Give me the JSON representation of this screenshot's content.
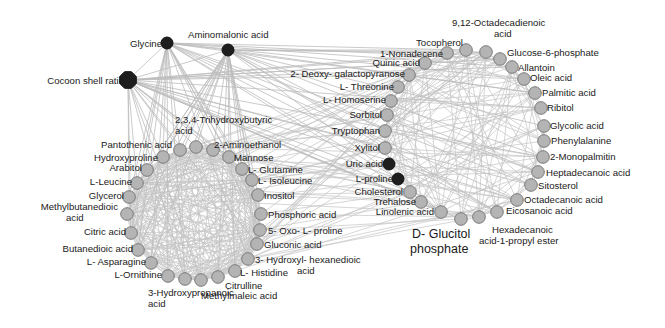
{
  "diagram": {
    "type": "correlation-network",
    "colors": {
      "edge": "#c4c4c4",
      "node_metabolite": "#b4b4b4",
      "node_metabolite_stroke": "#7a7a7a",
      "node_hub": "#1e1e1e",
      "text": "#1a1a1a"
    },
    "hubs": [
      {
        "id": "cocoon",
        "label": "Cocoon shell ratio",
        "x": 128,
        "y": 80,
        "r": 9,
        "lx": 124,
        "ly": 84,
        "anchor": "end",
        "size": "normal"
      },
      {
        "id": "glycine",
        "label": "Glycine",
        "x": 167,
        "y": 43,
        "r": 6,
        "lx": 162,
        "ly": 47,
        "anchor": "end",
        "size": "normal"
      },
      {
        "id": "aminomalonic",
        "label": "Aminomalonic acid",
        "x": 228,
        "y": 50,
        "r": 6,
        "lx": 188,
        "ly": 38,
        "anchor": "start",
        "size": "normal"
      }
    ],
    "clusters": [
      {
        "name": "left-cluster",
        "nodes": [
          {
            "label": "Hydroxyproline",
            "x": 163,
            "y": 157,
            "lines": [
              "Hydroxyproline"
            ],
            "lx": 158,
            "ly": 161,
            "anchor": "end"
          },
          {
            "label": "Pantothenic acid",
            "x": 180,
            "y": 150,
            "lines": [
              "Pantothenic acid"
            ],
            "lx": 172,
            "ly": 148,
            "anchor": "end"
          },
          {
            "label": "2,3,4-Trihydroxybutyric acid",
            "x": 196,
            "y": 147,
            "lines": [
              "2,3,4-Trihydroxybutyric",
              "acid"
            ],
            "lx": 175,
            "ly": 123,
            "anchor": "start"
          },
          {
            "label": "2-Aminoethanol",
            "x": 213,
            "y": 150,
            "lines": [
              "2-Aminoethanol"
            ],
            "lx": 214,
            "ly": 148,
            "anchor": "start"
          },
          {
            "label": "Mannose",
            "x": 229,
            "y": 157,
            "lines": [
              "Mannose"
            ],
            "lx": 234,
            "ly": 161,
            "anchor": "start"
          },
          {
            "label": "L-Glutamine",
            "x": 242,
            "y": 169,
            "lines": [
              "L- Glutamine"
            ],
            "lx": 248,
            "ly": 173,
            "anchor": "start"
          },
          {
            "label": "L-Isoleucine",
            "x": 252,
            "y": 180,
            "lines": [
              "L- Isoleucine"
            ],
            "lx": 258,
            "ly": 184,
            "anchor": "start"
          },
          {
            "label": "Inositol",
            "x": 258,
            "y": 195,
            "lines": [
              "Inositol"
            ],
            "lx": 264,
            "ly": 199,
            "anchor": "start"
          },
          {
            "label": "Phosphoric acid",
            "x": 261,
            "y": 214,
            "lines": [
              "Phosphoric acid"
            ],
            "lx": 268,
            "ly": 218,
            "anchor": "start"
          },
          {
            "label": "5-Oxo-L-proline",
            "x": 260,
            "y": 230,
            "lines": [
              "5- Oxo- L- proline"
            ],
            "lx": 268,
            "ly": 234,
            "anchor": "start"
          },
          {
            "label": "Gluconic acid",
            "x": 257,
            "y": 244,
            "lines": [
              "Gluconic acid"
            ],
            "lx": 264,
            "ly": 248,
            "anchor": "start"
          },
          {
            "label": "3-Hydroxyl-hexanedioic acid",
            "x": 248,
            "y": 259,
            "lines": [
              "3- Hydroxyl- hexanedioic",
              "acid"
            ],
            "lx": 255,
            "ly": 263,
            "anchor": "start",
            "line2_dx": 42
          },
          {
            "label": "L-Histidine",
            "x": 235,
            "y": 271,
            "lines": [
              "L- Histidine"
            ],
            "lx": 240,
            "ly": 276,
            "anchor": "start"
          },
          {
            "label": "Citrulline",
            "x": 218,
            "y": 277,
            "lines": [
              "Citrulline"
            ],
            "lx": 225,
            "ly": 289,
            "anchor": "start"
          },
          {
            "label": "Methylmaleic acid",
            "x": 201,
            "y": 280,
            "lines": [
              "Methylmaleic acid"
            ],
            "lx": 201,
            "ly": 299,
            "anchor": "start"
          },
          {
            "label": "3-Hydroxypropanoic acid",
            "x": 185,
            "y": 279,
            "lines": [
              "3-Hydroxypropanoic",
              "acid"
            ],
            "lx": 148,
            "ly": 296,
            "anchor": "middle-custom"
          },
          {
            "label": "L-Ornithine",
            "x": 168,
            "y": 276,
            "lines": [
              "L-Ornithine"
            ],
            "lx": 162,
            "ly": 278,
            "anchor": "end"
          },
          {
            "label": "L-Asparagine",
            "x": 151,
            "y": 263,
            "lines": [
              "L- Asparagine"
            ],
            "lx": 146,
            "ly": 265,
            "anchor": "end"
          },
          {
            "label": "Butanedioic acid",
            "x": 138,
            "y": 250,
            "lines": [
              "Butanedioic acid"
            ],
            "lx": 133,
            "ly": 252,
            "anchor": "end"
          },
          {
            "label": "Citric acid",
            "x": 131,
            "y": 233,
            "lines": [
              "Citric acid"
            ],
            "lx": 126,
            "ly": 235,
            "anchor": "end"
          },
          {
            "label": "Methylbutanedioic acid",
            "x": 127,
            "y": 214,
            "lines": [
              "Methylbutanedioic",
              "acid"
            ],
            "lx": 118,
            "ly": 210,
            "anchor": "end",
            "line2_x": 66
          },
          {
            "label": "Glycerol",
            "x": 129,
            "y": 197,
            "lines": [
              "Glycerol"
            ],
            "lx": 124,
            "ly": 199,
            "anchor": "end"
          },
          {
            "label": "L-Leucine",
            "x": 137,
            "y": 183,
            "lines": [
              "L-Leucine"
            ],
            "lx": 132,
            "ly": 185,
            "anchor": "end"
          },
          {
            "label": "Arabitol",
            "x": 147,
            "y": 170,
            "lines": [
              "Arabitol"
            ],
            "lx": 142,
            "ly": 171,
            "anchor": "end"
          }
        ]
      },
      {
        "name": "right-cluster",
        "nodes": [
          {
            "label": "1-Nonadecene",
            "x": 447,
            "y": 53,
            "lines": [
              "1-Nonadecene"
            ],
            "lx": 443,
            "ly": 57,
            "anchor": "end"
          },
          {
            "label": "Tocopherol",
            "x": 466,
            "y": 50,
            "lines": [
              "Tocopherol"
            ],
            "lx": 463,
            "ly": 46,
            "anchor": "end"
          },
          {
            "label": "9,12-Octadecadienoic acid",
            "x": 486,
            "y": 52,
            "lines": [
              "9,12-Octadecadienoic",
              "acid"
            ],
            "lx": 452,
            "ly": 26,
            "anchor": "start",
            "line2_dx": 42
          },
          {
            "label": "Glucose-6-phosphate",
            "x": 500,
            "y": 59,
            "lines": [
              "Glucose-6-phosphate"
            ],
            "lx": 507,
            "ly": 56,
            "anchor": "start"
          },
          {
            "label": "Allantoin",
            "x": 512,
            "y": 67,
            "lines": [
              "Allantoin"
            ],
            "lx": 518,
            "ly": 71,
            "anchor": "start"
          },
          {
            "label": "Oleic acid",
            "x": 524,
            "y": 79,
            "lines": [
              "Oleic acid"
            ],
            "lx": 530,
            "ly": 81,
            "anchor": "start"
          },
          {
            "label": "Palmitic acid",
            "x": 535,
            "y": 93,
            "lines": [
              "Palmitic acid"
            ],
            "lx": 542,
            "ly": 96,
            "anchor": "start"
          },
          {
            "label": "Ribitol",
            "x": 541,
            "y": 108,
            "lines": [
              "Ribitol"
            ],
            "lx": 547,
            "ly": 111,
            "anchor": "start"
          },
          {
            "label": "Glycolic acid",
            "x": 544,
            "y": 126,
            "lines": [
              "Glycolic acid"
            ],
            "lx": 550,
            "ly": 129,
            "anchor": "start"
          },
          {
            "label": "Phenylalanine",
            "x": 544,
            "y": 141,
            "lines": [
              "Phenylalanine"
            ],
            "lx": 551,
            "ly": 144,
            "anchor": "start"
          },
          {
            "label": "2-Monopalmitin",
            "x": 543,
            "y": 157,
            "lines": [
              "2-Monopalmitin"
            ],
            "lx": 550,
            "ly": 160,
            "anchor": "start"
          },
          {
            "label": "Heptadecanoic acid",
            "x": 538,
            "y": 172,
            "lines": [
              "Heptadecanoic acid"
            ],
            "lx": 546,
            "ly": 176,
            "anchor": "start"
          },
          {
            "label": "Sitosterol",
            "x": 531,
            "y": 185,
            "lines": [
              "Sitosterol"
            ],
            "lx": 538,
            "ly": 189,
            "anchor": "start"
          },
          {
            "label": "Octadecanoic acid",
            "x": 517,
            "y": 200,
            "lines": [
              "Octadecanoic acid"
            ],
            "lx": 524,
            "ly": 203,
            "anchor": "start"
          },
          {
            "label": "Eicosanoic acid",
            "x": 497,
            "y": 212,
            "lines": [
              "Eicosanoic acid"
            ],
            "lx": 506,
            "ly": 214,
            "anchor": "start"
          },
          {
            "label": "Hexadecanoic acid-1-propyl ester",
            "x": 479,
            "y": 217,
            "lines": [
              "Hexadecanoic",
              "acid-1-propyl ester"
            ],
            "lx": 492,
            "ly": 233,
            "anchor": "start",
            "line2_dx": -13
          },
          {
            "label": "D-Glucitol phosphate",
            "x": 461,
            "y": 219,
            "lines": [
              "D- Glucitol",
              "phosphate"
            ],
            "lx": 412,
            "ly": 238,
            "anchor": "start",
            "big": true,
            "line2_dx": -2
          },
          {
            "label": "Linolenic acid",
            "x": 441,
            "y": 212,
            "lines": [
              "Linolenic acid"
            ],
            "lx": 434,
            "ly": 215,
            "anchor": "end"
          },
          {
            "label": "Trehalose",
            "x": 421,
            "y": 202,
            "lines": [
              "Trehalose"
            ],
            "lx": 416,
            "ly": 205,
            "anchor": "end"
          },
          {
            "label": "Cholesterol",
            "x": 410,
            "y": 192,
            "lines": [
              "Cholesterol"
            ],
            "lx": 403,
            "ly": 195,
            "anchor": "end"
          },
          {
            "label": "Tryptophan",
            "x": 385,
            "y": 131,
            "lines": [
              "Tryptophan"
            ],
            "lx": 380,
            "ly": 134,
            "anchor": "end"
          },
          {
            "label": "Sorbitol",
            "x": 387,
            "y": 115,
            "lines": [
              "Sorbitol"
            ],
            "lx": 382,
            "ly": 118,
            "anchor": "end"
          },
          {
            "label": "L-Homoserine",
            "x": 391,
            "y": 101,
            "lines": [
              "L- Homoserine"
            ],
            "lx": 386,
            "ly": 103,
            "anchor": "end"
          },
          {
            "label": "L-Threonine",
            "x": 398,
            "y": 87,
            "lines": [
              "L- Threonine"
            ],
            "lx": 394,
            "ly": 90,
            "anchor": "end"
          },
          {
            "label": "2-Deoxy-galactopyranose",
            "x": 409,
            "y": 75,
            "lines": [
              "2- Deoxy- galactopyranose"
            ],
            "lx": 405,
            "ly": 77,
            "anchor": "end"
          },
          {
            "label": "Quinic acid",
            "x": 425,
            "y": 63,
            "lines": [
              "Quinic acid"
            ],
            "lx": 420,
            "ly": 66,
            "anchor": "end"
          },
          {
            "label": "Xylitol",
            "x": 385,
            "y": 148,
            "lines": [
              "Xylitol"
            ],
            "lx": 380,
            "ly": 151,
            "anchor": "end"
          }
        ]
      }
    ],
    "dark_nodes": [
      {
        "label": "Uric acid",
        "x": 389,
        "y": 164,
        "r": 6,
        "lx": 383,
        "ly": 167,
        "anchor": "end"
      },
      {
        "label": "L-proline",
        "x": 398,
        "y": 179,
        "r": 6,
        "lx": 393,
        "ly": 182,
        "anchor": "end"
      }
    ]
  }
}
